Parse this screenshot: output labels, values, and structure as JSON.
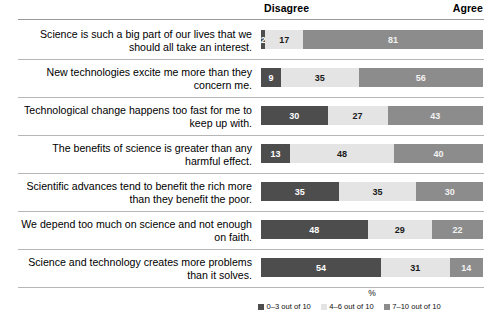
{
  "header": {
    "disagree": "Disagree",
    "agree": "Agree"
  },
  "axis": {
    "xlabel": "%"
  },
  "legend": {
    "items": [
      {
        "label": "0–3 out of 10",
        "color": "#4d4d4d"
      },
      {
        "label": "4–6 out of 10",
        "color": "#e4e4e4"
      },
      {
        "label": "7–10 out of 10",
        "color": "#8c8c8c"
      }
    ]
  },
  "chart_data": {
    "type": "bar",
    "subtype": "stacked-horizontal-100pct",
    "title": "",
    "xlabel": "%",
    "ylabel": "",
    "xlim": [
      0,
      100
    ],
    "grid": false,
    "legend_position": "bottom",
    "annotations": [
      "Disagree",
      "Agree"
    ],
    "series": [
      {
        "name": "0–3 out of 10",
        "color": "#4d4d4d",
        "values": [
          2,
          9,
          30,
          13,
          35,
          48,
          54
        ]
      },
      {
        "name": "4–6 out of 10",
        "color": "#e4e4e4",
        "values": [
          17,
          35,
          27,
          48,
          35,
          29,
          31
        ]
      },
      {
        "name": "7–10 out of 10",
        "color": "#8c8c8c",
        "values": [
          81,
          56,
          43,
          40,
          30,
          22,
          14
        ]
      }
    ],
    "categories": [
      "Science is such a big part of our lives that we should all take an interest.",
      "New technologies excite me more than they concern me.",
      "Technological change happens too fast for me to keep up with.",
      "The benefits of science is greater than any harmful effect.",
      "Scientific advances tend to benefit the rich more than they benefit the poor.",
      "We depend too much on science and not enough on faith.",
      "Science and technology creates more problems than it solves."
    ]
  },
  "rows": [
    {
      "line1": "Science is such a big part of our lives that we",
      "line2": "should all take an interest.",
      "segments": [
        {
          "value": "2",
          "pct": 2
        },
        {
          "value": "17",
          "pct": 17
        },
        {
          "value": "81",
          "pct": 81
        }
      ]
    },
    {
      "line1": "New technologies excite me more than they",
      "line2": "concern me.",
      "segments": [
        {
          "value": "9",
          "pct": 9
        },
        {
          "value": "35",
          "pct": 35
        },
        {
          "value": "56",
          "pct": 56
        }
      ]
    },
    {
      "line1": "Technological change happens too fast for me to",
      "line2": "keep up with.",
      "segments": [
        {
          "value": "30",
          "pct": 30
        },
        {
          "value": "27",
          "pct": 27
        },
        {
          "value": "43",
          "pct": 43
        }
      ]
    },
    {
      "line1": "The benefits of science is greater than any",
      "line2": "harmful effect.",
      "segments": [
        {
          "value": "13",
          "pct": 13
        },
        {
          "value": "48",
          "pct": 47
        },
        {
          "value": "40",
          "pct": 40
        }
      ]
    },
    {
      "line1": "Scientific advances tend to benefit the rich more",
      "line2": "than they benefit the poor.",
      "segments": [
        {
          "value": "35",
          "pct": 35
        },
        {
          "value": "35",
          "pct": 35
        },
        {
          "value": "30",
          "pct": 30
        }
      ]
    },
    {
      "line1": "We depend too much on science and not enough",
      "line2": "on faith.",
      "segments": [
        {
          "value": "48",
          "pct": 48
        },
        {
          "value": "29",
          "pct": 29
        },
        {
          "value": "22",
          "pct": 23
        }
      ]
    },
    {
      "line1": "Science and technology creates more problems",
      "line2": "than it solves.",
      "segments": [
        {
          "value": "54",
          "pct": 54
        },
        {
          "value": "31",
          "pct": 31
        },
        {
          "value": "14",
          "pct": 15
        }
      ]
    }
  ]
}
